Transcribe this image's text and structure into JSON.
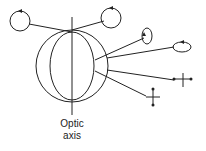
{
  "diagram": {
    "title": "",
    "labels": {
      "optic_axis_line1": "Optic",
      "optic_axis_line2": "axis"
    },
    "elements": [
      {
        "name": "crystal-outer-circle",
        "type": "circle"
      },
      {
        "name": "crystal-inner-ellipse",
        "type": "ellipse"
      },
      {
        "name": "optic-axis-line",
        "type": "line"
      },
      {
        "name": "circular-polarization-left",
        "type": "circle-with-arrow"
      },
      {
        "name": "circular-polarization-right",
        "type": "circle-with-arrow"
      },
      {
        "name": "elliptical-polarization-vertical",
        "type": "ellipse-with-arrow"
      },
      {
        "name": "elliptical-polarization-horizontal",
        "type": "ellipse-with-arrow"
      },
      {
        "name": "linear-polarization-horizontal",
        "type": "double-arrow-cross"
      },
      {
        "name": "linear-polarization-vertical",
        "type": "double-arrow-cross"
      }
    ],
    "colors": {
      "stroke": "#222222",
      "background": "#ffffff"
    }
  }
}
